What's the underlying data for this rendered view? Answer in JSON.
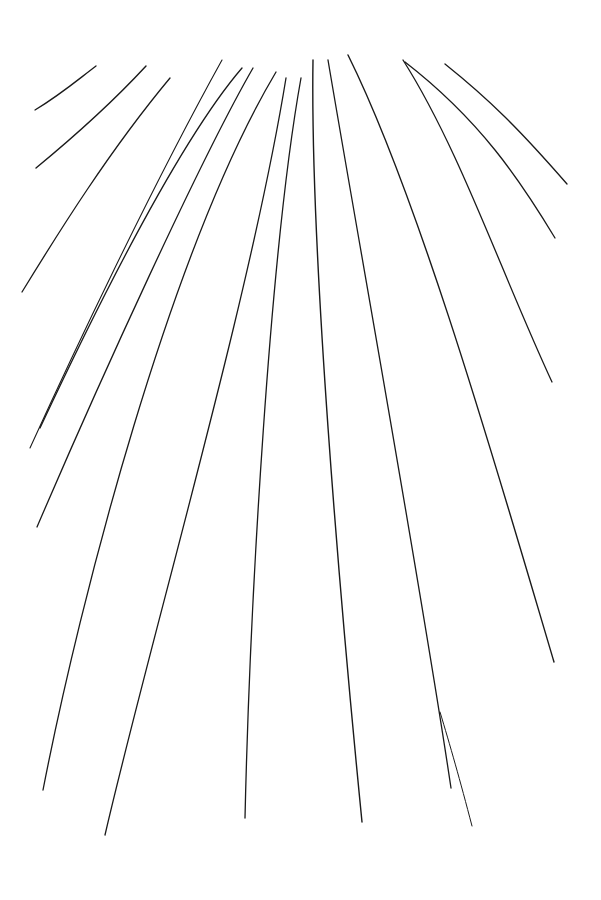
{
  "drawing": {
    "description": "Hand-drawn ink sketch of lines radiating downward",
    "stroke_color": "#1a1a1a",
    "background": "#ffffff",
    "strokes": [
      {
        "d": "M35,110 C60,95 75,82 96,66",
        "w": 1.3
      },
      {
        "d": "M36,168 C70,140 110,105 146,66",
        "w": 1.4
      },
      {
        "d": "M22,292 C60,230 110,150 170,78",
        "w": 1.3
      },
      {
        "d": "M30,448 C70,360 150,190 222,60",
        "w": 1.1
      },
      {
        "d": "M40,428 C100,300 180,140 242,68",
        "w": 1.3
      },
      {
        "d": "M37,527 C100,380 200,160 253,68",
        "w": 1.3
      },
      {
        "d": "M43,790 C80,600 170,250 276,72",
        "w": 1.3
      },
      {
        "d": "M105,835 C150,640 250,300 286,78",
        "w": 1.3
      },
      {
        "d": "M245,818 C250,600 270,250 301,78",
        "w": 1.3
      },
      {
        "d": "M362,822 C340,600 310,250 313,60",
        "w": 1.4
      },
      {
        "d": "M451,788 C420,580 360,250 328,60",
        "w": 1.3
      },
      {
        "d": "M472,826 C460,780 450,745 440,712",
        "w": 1.0
      },
      {
        "d": "M554,662 C500,480 420,200 348,55",
        "w": 1.4
      },
      {
        "d": "M552,382 C500,270 460,150 403,60",
        "w": 1.3
      },
      {
        "d": "M555,238 C520,180 480,120 405,62",
        "w": 1.3
      },
      {
        "d": "M567,184 C520,130 490,100 445,64",
        "w": 1.3
      }
    ]
  }
}
